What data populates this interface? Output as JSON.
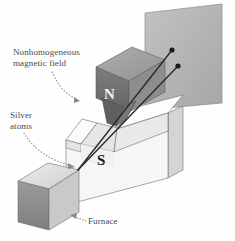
{
  "figure": {
    "labels": {
      "field_line1": "Nonhomogeneous",
      "field_line2": "magnetic field",
      "silver_line1": "Silver",
      "silver_line2": "atoms",
      "furnace": "Furnace",
      "pole_north": "N",
      "pole_south": "S"
    },
    "icons": {
      "field_pointer": "dotted-arrow-icon",
      "silver_pointer": "dotted-arrow-icon",
      "furnace_pointer": "dotted-arrow-icon"
    },
    "colors": {
      "background": "#fefefe",
      "label_text": "#4a4a4a",
      "pole_north_text": "#f2f2f2",
      "pole_south_text": "#1a1a1a",
      "screen_fill": "#b9b9b9",
      "magnet_top": "#a0a0a0",
      "magnet_front": "#6f6f6f",
      "magnet_side": "#8a8a8a",
      "yoke_top": "#ffffff",
      "yoke_front": "#f2f2f2",
      "yoke_side": "#d8d8d8",
      "furnace_top": "#e2e2e2",
      "furnace_front": "#8e8e8e",
      "furnace_side": "#c6c6c6",
      "beam_stroke": "#2b2b2b",
      "outline": "#6b6b6b"
    },
    "beams": [
      {
        "name": "upper-beam",
        "end_x": 172,
        "end_y": 50
      },
      {
        "name": "lower-beam",
        "end_x": 178,
        "end_y": 66
      }
    ],
    "beam_origin": {
      "x": 78,
      "y": 170
    }
  }
}
